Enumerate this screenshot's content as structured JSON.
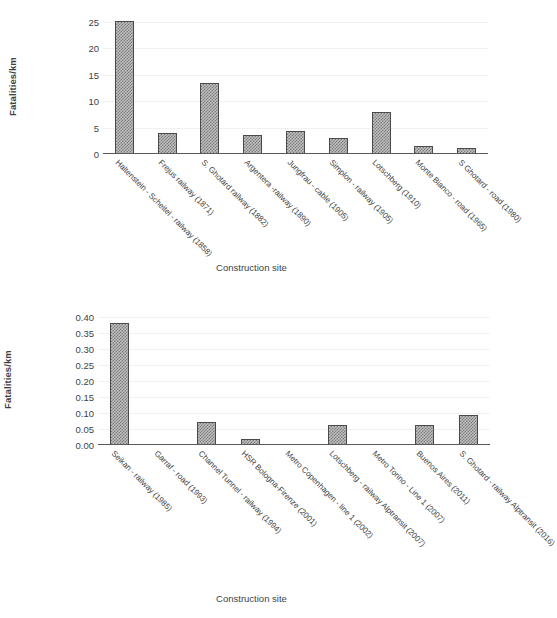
{
  "chart_data": [
    {
      "id": "top",
      "type": "bar",
      "title": "",
      "xlabel": "Construction site",
      "ylabel": "Fatalities/km",
      "ylim": [
        0,
        25
      ],
      "ytick_step": 5,
      "ytick_labels": [
        "0",
        "5",
        "10",
        "15",
        "20",
        "25"
      ],
      "ytick_values": [
        0,
        5,
        10,
        15,
        20,
        25
      ],
      "grid": true,
      "legend": "none",
      "categories": [
        "Haltenstein - Scheitel - railway (1858)",
        "Frejus railway (1871)",
        "S. Ghotard railway (1882)",
        "Argentera -railway (1890)",
        "Jungfrau - cable (1905)",
        "Simplon - railway (1905)",
        "Lotschberg (1910)",
        "Monte Bianco - road (1965)",
        "S Ghotard - road (1980)"
      ],
      "values": [
        25.2,
        4.0,
        13.4,
        3.6,
        4.4,
        3.0,
        8.0,
        1.6,
        1.2
      ]
    },
    {
      "id": "bottom",
      "type": "bar",
      "title": "",
      "xlabel": "Construction site",
      "ylabel": "Fatalities/km",
      "ylim": [
        0,
        0.4
      ],
      "ytick_step": 0.05,
      "ytick_labels": [
        "0.00",
        "0.05",
        "0.10",
        "0.15",
        "0.20",
        "0.25",
        "0.30",
        "0.35",
        "0.40"
      ],
      "ytick_values": [
        0,
        0.05,
        0.1,
        0.15,
        0.2,
        0.25,
        0.3,
        0.35,
        0.4
      ],
      "grid": true,
      "legend": "none",
      "categories": [
        "Seikan - railway (1985)",
        "Garraf - road (1993)",
        "Channel Tunnel - railway (1994)",
        "HSR Bologna-Firenze (2001)",
        "Metro Copenhagen - line 1 (2002)",
        "Lotschberg - railway Alptransit (2007)",
        "Metro Torino - Line 1 (2007)",
        "Buenos Aires (2011)",
        "S. Ghotard - railway Alptransit (2016)"
      ],
      "values": [
        0.38,
        0.0,
        0.072,
        0.02,
        0.0,
        0.062,
        0.0,
        0.062,
        0.094
      ]
    }
  ],
  "colors": {
    "bar_fill": "#bfbfbf",
    "bar_hatch": "#7b7b7b",
    "bar_border": "#4a4a4a",
    "axis": "#595959",
    "grid": "#f1f1f1",
    "text": "#3f3f3f",
    "background": "#ffffff"
  }
}
